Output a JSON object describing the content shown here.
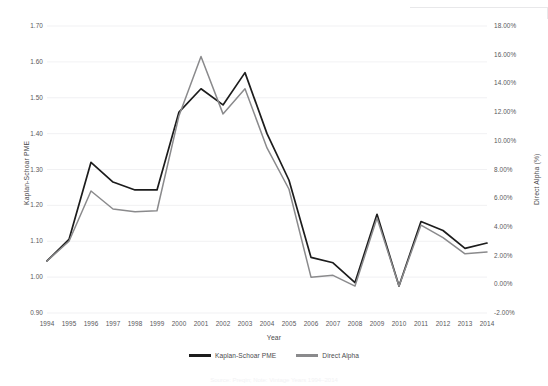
{
  "chart_data": {
    "type": "line",
    "title": "",
    "xlabel": "Year",
    "ylabel": "Kaplan-Schoar PME",
    "ylabel_right": "Direct Alpha (%)",
    "grid": true,
    "legend_position": "bottom-center",
    "categories": [
      "1994",
      "1995",
      "1996",
      "1997",
      "1998",
      "1999",
      "2000",
      "2001",
      "2002",
      "2003",
      "2004",
      "2005",
      "2006",
      "2007",
      "2008",
      "2009",
      "2010",
      "2011",
      "2012",
      "2013",
      "2014"
    ],
    "x": [
      1994,
      1995,
      1996,
      1997,
      1998,
      1999,
      2000,
      2001,
      2002,
      2003,
      2004,
      2005,
      2006,
      2007,
      2008,
      2009,
      2010,
      2011,
      2012,
      2013,
      2014
    ],
    "ylim": [
      0.9,
      1.7
    ],
    "yticks": [
      "0.90",
      "1.00",
      "1.10",
      "1.20",
      "1.30",
      "1.40",
      "1.50",
      "1.60",
      "1.70"
    ],
    "ylim_right": [
      -2.0,
      18.0
    ],
    "yticks_right": [
      "-2.00%",
      "0.00%",
      "2.00%",
      "4.00%",
      "6.00%",
      "8.00%",
      "10.00%",
      "12.00%",
      "14.00%",
      "16.00%",
      "18.00%"
    ],
    "series": [
      {
        "name": "Kaplan-Schoar PME",
        "color": "#1c1c1c",
        "axis": "left",
        "values": [
          1.045,
          1.105,
          1.32,
          1.265,
          1.243,
          1.243,
          1.46,
          1.525,
          1.48,
          1.57,
          1.4,
          1.27,
          1.055,
          1.04,
          0.985,
          1.175,
          0.975,
          1.155,
          1.13,
          1.08,
          1.095
        ]
      },
      {
        "name": "Direct Alpha",
        "color": "#8a8a8c",
        "axis": "right",
        "values": [
          1.045,
          1.1,
          1.24,
          1.19,
          1.182,
          1.185,
          1.45,
          1.615,
          1.455,
          1.525,
          1.36,
          1.245,
          1.0,
          1.005,
          0.975,
          1.165,
          0.975,
          1.145,
          1.11,
          1.065,
          1.07
        ]
      }
    ],
    "direct_alpha_values_pct": [
      1.2,
      2.6,
      6.1,
      4.8,
      4.6,
      4.7,
      11.4,
      15.5,
      11.5,
      13.2,
      9.0,
      6.2,
      0.1,
      0.2,
      -0.5,
      4.4,
      0.0,
      4.1,
      3.2,
      2.1,
      2.2
    ]
  },
  "axis": {
    "left_title": "Kaplan-Schoar PME",
    "right_title": "Direct Alpha (%)",
    "x_title": "Year"
  },
  "legend": {
    "items": [
      {
        "label": "Kaplan-Schoar PME",
        "color": "#1c1c1c"
      },
      {
        "label": "Direct Alpha",
        "color": "#8a8a8c"
      }
    ]
  },
  "caption": {
    "text": "Source: Preqin;  Note: Vintage Years 1994–2014"
  }
}
